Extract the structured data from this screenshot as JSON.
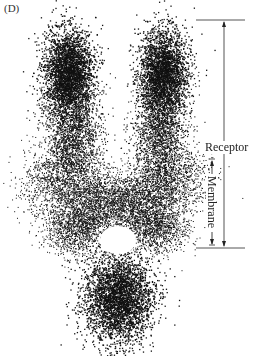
{
  "figure": {
    "panel_label": "(D)",
    "annotations": {
      "receptor_label": "Receptor",
      "membrane_label": "Membrane"
    },
    "scale_bars": {
      "receptor": {
        "x": 224,
        "y_top": 20,
        "y_bottom": 248
      },
      "membrane": {
        "x": 212,
        "y_top": 160,
        "y_bottom": 245
      },
      "top_bar": {
        "x1": 196,
        "x2": 245,
        "y": 20
      },
      "bottom_bar": {
        "x1": 196,
        "x2": 245,
        "y": 248
      }
    },
    "colors": {
      "ink": "#1a1a1a",
      "line": "#555555",
      "background": "#ffffff"
    }
  }
}
